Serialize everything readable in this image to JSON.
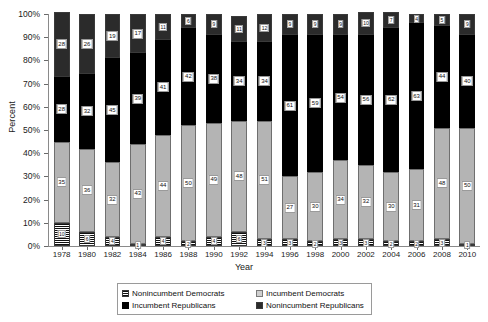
{
  "chart_data": {
    "type": "bar",
    "subtype": "stacked-percent-column",
    "title": "",
    "xlabel": "Year",
    "ylabel": "Percent",
    "ylim": [
      0,
      100
    ],
    "ytick_labels": [
      "100%",
      "90%",
      "80%",
      "70%",
      "60%",
      "50%",
      "40%",
      "30%",
      "20%",
      "10%",
      "0%"
    ],
    "ytick_values": [
      100,
      90,
      80,
      70,
      60,
      50,
      40,
      30,
      20,
      10,
      0
    ],
    "grid": false,
    "legend_position": "bottom",
    "categories": [
      "1978",
      "1980",
      "1982",
      "1984",
      "1986",
      "1988",
      "1990",
      "1992",
      "1994",
      "1996",
      "1998",
      "2000",
      "2002",
      "2004",
      "2006",
      "2008",
      "2010"
    ],
    "series": [
      {
        "name": "Nonincumbent Democrats",
        "pattern": "horizontal-stripes",
        "values": [
          10,
          6,
          4,
          1,
          4,
          2,
          4,
          6,
          3,
          3,
          2,
          3,
          3,
          2,
          2,
          3,
          1
        ]
      },
      {
        "name": "Incumbent Democrats",
        "pattern": "solid-light-gray",
        "values": [
          35,
          36,
          32,
          43,
          44,
          50,
          49,
          48,
          51,
          27,
          30,
          34,
          32,
          30,
          31,
          48,
          50
        ]
      },
      {
        "name": "Incumbent Republicans",
        "pattern": "solid-black",
        "values": [
          28,
          32,
          45,
          39,
          41,
          42,
          38,
          34,
          34,
          61,
          59,
          54,
          56,
          62,
          63,
          44,
          40
        ]
      },
      {
        "name": "Nonincumbent Republicans",
        "pattern": "checkered",
        "values": [
          28,
          26,
          19,
          17,
          11,
          6,
          9,
          11,
          12,
          9,
          9,
          9,
          10,
          7,
          4,
          5,
          9
        ]
      }
    ]
  },
  "legend": {
    "items": [
      {
        "label": "Nonincumbent Democrats",
        "swatch": "noninc-dem"
      },
      {
        "label": "Incumbent Democrats",
        "swatch": "inc-dem"
      },
      {
        "label": "Incumbent Republicans",
        "swatch": "inc-rep"
      },
      {
        "label": "Nonincumbent Republicans",
        "swatch": "noninc-rep"
      }
    ]
  },
  "colors": {
    "incumbent_republicans": "#000000",
    "incumbent_democrats": "#b4b4b4",
    "nonincumbent_republicans": "#9a9a9a",
    "nonincumbent_democrats": "#d8d8d8",
    "axis": "#8a8a8a",
    "text": "#1a1a1a"
  }
}
